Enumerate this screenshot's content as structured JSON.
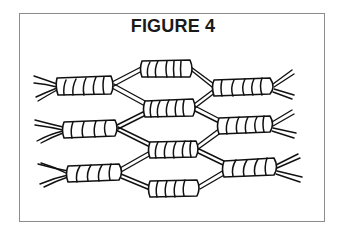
{
  "figure": {
    "title": "FIGURE 4",
    "colors": {
      "line": "#111111",
      "border": "#8c8c8c",
      "background": "#ffffff"
    },
    "knots": [
      {
        "id": "row1-left",
        "x": 55,
        "y": 85,
        "w": 58
      },
      {
        "id": "top-middle",
        "x": 140,
        "y": 68,
        "w": 52
      },
      {
        "id": "row1-right",
        "x": 213,
        "y": 86,
        "w": 62
      },
      {
        "id": "mid-upper",
        "x": 143,
        "y": 108,
        "w": 52
      },
      {
        "id": "row2-left",
        "x": 62,
        "y": 128,
        "w": 56
      },
      {
        "id": "row2-right",
        "x": 218,
        "y": 124,
        "w": 55
      },
      {
        "id": "mid-lower",
        "x": 148,
        "y": 149,
        "w": 50
      },
      {
        "id": "row3-left",
        "x": 67,
        "y": 172,
        "w": 55
      },
      {
        "id": "row3-right",
        "x": 222,
        "y": 167,
        "w": 55
      },
      {
        "id": "bottom-middle",
        "x": 148,
        "y": 188,
        "w": 52
      }
    ]
  }
}
